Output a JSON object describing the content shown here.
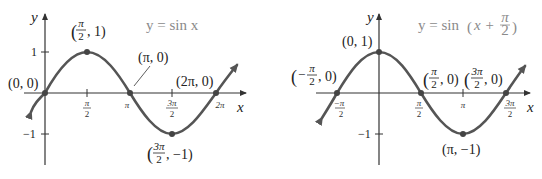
{
  "left_graph": {
    "title": "y = sin x",
    "x_axis_label": "x",
    "y_axis_label": "y",
    "y_ticks": [
      "1",
      "−1"
    ],
    "x_ticks": [
      {
        "num": "π",
        "den": "2"
      },
      {
        "num": "π",
        "den": ""
      },
      {
        "num": "3π",
        "den": "2"
      },
      {
        "num": "2π",
        "den": ""
      }
    ],
    "points": [
      {
        "label": "(0, 0)"
      },
      {
        "label": "(π/2, 1)",
        "num": "π",
        "den": "2",
        "rest": ", 1)"
      },
      {
        "label": "(π, 0)"
      },
      {
        "label": "(3π/2, −1)",
        "num": "3π",
        "den": "2",
        "rest": ", −1)"
      },
      {
        "label": "(2π, 0)"
      }
    ]
  },
  "right_graph": {
    "title_prefix": "y = sin ",
    "title_inner": "x + ",
    "title_frac_num": "π",
    "title_frac_den": "2",
    "x_axis_label": "x",
    "y_axis_label": "y",
    "y_ticks": [
      "−1"
    ],
    "x_ticks": [
      {
        "num": "−π",
        "den": "2"
      },
      {
        "num": "π",
        "den": "2"
      },
      {
        "num": "π",
        "den": ""
      },
      {
        "num": "3π",
        "den": "2"
      }
    ],
    "points": [
      {
        "label": "(−π/2, 0)",
        "num": "π",
        "den": "2"
      },
      {
        "label": "(0, 1)"
      },
      {
        "label": "(π/2, 0)",
        "num": "π",
        "den": "2"
      },
      {
        "label": "(3π/2, 0)",
        "num": "3π",
        "den": "2"
      },
      {
        "label": "(π, −1)"
      }
    ]
  }
}
